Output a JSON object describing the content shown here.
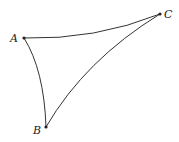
{
  "diagram": {
    "type": "curved-triangle",
    "vertices": [
      {
        "label": "A",
        "x": 24,
        "y": 38,
        "lx": 10,
        "ly": 42
      },
      {
        "label": "C",
        "x": 160,
        "y": 14,
        "lx": 164,
        "ly": 18
      },
      {
        "label": "B",
        "x": 46,
        "y": 127,
        "lx": 33,
        "ly": 134
      }
    ],
    "edges": [
      {
        "from": "A",
        "to": "C",
        "d": "M24,38 Q95,40 160,14"
      },
      {
        "from": "A",
        "to": "B",
        "d": "M24,38 Q44,70 46,127"
      },
      {
        "from": "C",
        "to": "B",
        "d": "M160,14 Q85,60 46,127"
      }
    ],
    "colors": {
      "stroke": "#333333",
      "point": "#222222"
    }
  }
}
